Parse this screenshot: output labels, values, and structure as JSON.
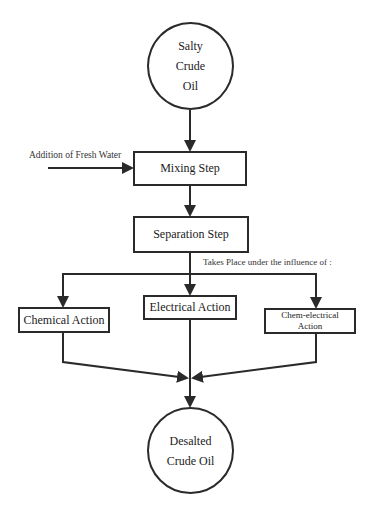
{
  "diagram": {
    "type": "flowchart",
    "nodes": {
      "start": {
        "shape": "circle",
        "lines": [
          "Salty",
          "Crude",
          "Oil"
        ]
      },
      "mixing": {
        "shape": "box",
        "label": "Mixing Step"
      },
      "separation": {
        "shape": "box",
        "label": "Separation Step"
      },
      "chemical": {
        "shape": "box",
        "label": "Chemical Action"
      },
      "electrical": {
        "shape": "box",
        "label": "Electrical Action"
      },
      "chem_electrical": {
        "shape": "box",
        "lines": [
          "Chem-electrical",
          "Action"
        ]
      },
      "end": {
        "shape": "circle",
        "lines": [
          "Desalted",
          "Crude Oil"
        ]
      }
    },
    "annotations": {
      "fresh_water": "Addition of Fresh Water",
      "influence": "Takes Place under the influence of :"
    },
    "edges": [
      {
        "from": "start",
        "to": "mixing"
      },
      {
        "from": "fresh_water",
        "to": "mixing"
      },
      {
        "from": "mixing",
        "to": "separation"
      },
      {
        "from": "separation",
        "to": "chemical"
      },
      {
        "from": "separation",
        "to": "electrical"
      },
      {
        "from": "separation",
        "to": "chem_electrical"
      },
      {
        "from": "chemical",
        "to": "end"
      },
      {
        "from": "electrical",
        "to": "end"
      },
      {
        "from": "chem_electrical",
        "to": "end"
      }
    ],
    "colors": {
      "stroke": "#2a2a2a",
      "background": "#ffffff"
    }
  }
}
